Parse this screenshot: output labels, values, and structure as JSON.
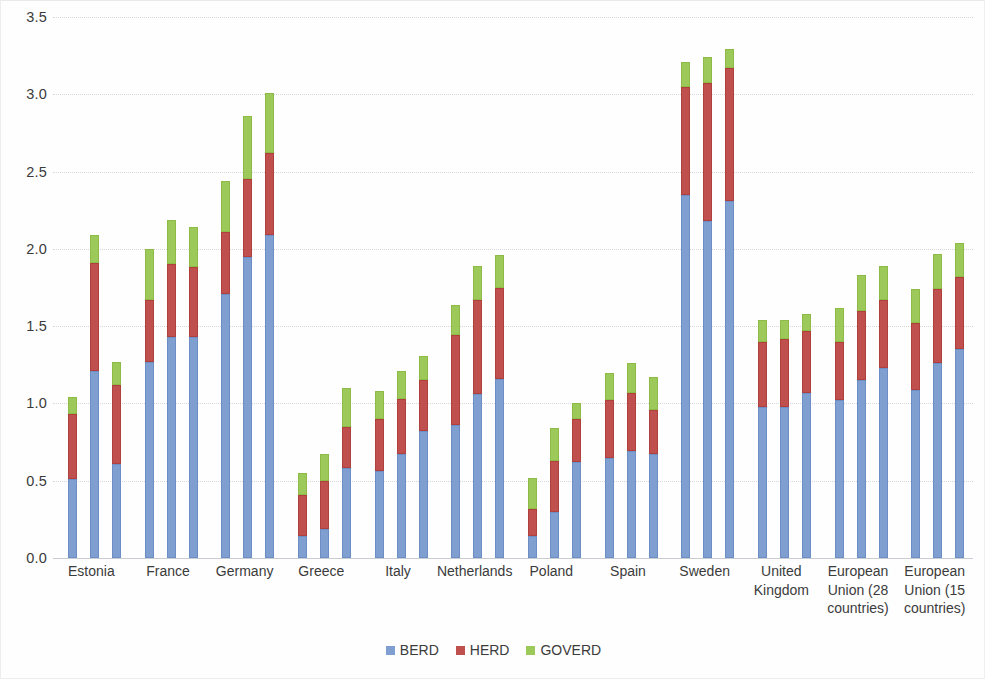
{
  "chart_data": {
    "type": "bar",
    "subtype": "stacked-bar-grouped",
    "title": "",
    "xlabel": "",
    "ylabel": "",
    "ylim": [
      0.0,
      3.5
    ],
    "ytick_labels": [
      "0.0",
      "0.5",
      "1.0",
      "1.5",
      "2.0",
      "2.5",
      "3.0",
      "3.5"
    ],
    "ytick_values": [
      0.0,
      0.5,
      1.0,
      1.5,
      2.0,
      2.5,
      3.0,
      3.5
    ],
    "grid": true,
    "legend_position": "bottom",
    "series": [
      {
        "name": "BERD",
        "color": "#7f9fd0"
      },
      {
        "name": "HERD",
        "color": "#c0504d"
      },
      {
        "name": "GOVERD",
        "color": "#9dc95a"
      }
    ],
    "categories": [
      "Estonia",
      "France",
      "Germany",
      "Greece",
      "Italy",
      "Netherlands",
      "Poland",
      "Spain",
      "Sweden",
      "United\nKingdom",
      "European\nUnion (28\ncountries)",
      "European\nUnion (15\ncountries)"
    ],
    "bars_per_category": 3,
    "groups": [
      {
        "category": "Estonia",
        "bars": [
          {
            "BERD": 0.51,
            "HERD": 0.42,
            "GOVERD": 0.11
          },
          {
            "BERD": 1.21,
            "HERD": 0.7,
            "GOVERD": 0.18
          },
          {
            "BERD": 0.61,
            "HERD": 0.51,
            "GOVERD": 0.15
          }
        ]
      },
      {
        "category": "France",
        "bars": [
          {
            "BERD": 1.27,
            "HERD": 0.4,
            "GOVERD": 0.33
          },
          {
            "BERD": 1.43,
            "HERD": 0.47,
            "GOVERD": 0.29
          },
          {
            "BERD": 1.43,
            "HERD": 0.45,
            "GOVERD": 0.26
          }
        ]
      },
      {
        "category": "Germany",
        "bars": [
          {
            "BERD": 1.71,
            "HERD": 0.4,
            "GOVERD": 0.33
          },
          {
            "BERD": 1.95,
            "HERD": 0.5,
            "GOVERD": 0.41
          },
          {
            "BERD": 2.09,
            "HERD": 0.53,
            "GOVERD": 0.39
          }
        ]
      },
      {
        "category": "Greece",
        "bars": [
          {
            "BERD": 0.14,
            "HERD": 0.27,
            "GOVERD": 0.14
          },
          {
            "BERD": 0.19,
            "HERD": 0.31,
            "GOVERD": 0.17
          },
          {
            "BERD": 0.58,
            "HERD": 0.27,
            "GOVERD": 0.25
          }
        ]
      },
      {
        "category": "Italy",
        "bars": [
          {
            "BERD": 0.56,
            "HERD": 0.34,
            "GOVERD": 0.18
          },
          {
            "BERD": 0.67,
            "HERD": 0.36,
            "GOVERD": 0.18
          },
          {
            "BERD": 0.82,
            "HERD": 0.33,
            "GOVERD": 0.16
          }
        ]
      },
      {
        "category": "Netherlands",
        "bars": [
          {
            "BERD": 0.86,
            "HERD": 0.58,
            "GOVERD": 0.2
          },
          {
            "BERD": 1.06,
            "HERD": 0.61,
            "GOVERD": 0.22
          },
          {
            "BERD": 1.16,
            "HERD": 0.59,
            "GOVERD": 0.21
          }
        ]
      },
      {
        "category": "Poland",
        "bars": [
          {
            "BERD": 0.14,
            "HERD": 0.18,
            "GOVERD": 0.2
          },
          {
            "BERD": 0.3,
            "HERD": 0.33,
            "GOVERD": 0.21
          },
          {
            "BERD": 0.62,
            "HERD": 0.28,
            "GOVERD": 0.1
          }
        ]
      },
      {
        "category": "Spain",
        "bars": [
          {
            "BERD": 0.65,
            "HERD": 0.37,
            "GOVERD": 0.18
          },
          {
            "BERD": 0.69,
            "HERD": 0.38,
            "GOVERD": 0.19
          },
          {
            "BERD": 0.67,
            "HERD": 0.29,
            "GOVERD": 0.21
          }
        ]
      },
      {
        "category": "Sweden",
        "bars": [
          {
            "BERD": 2.35,
            "HERD": 0.7,
            "GOVERD": 0.16
          },
          {
            "BERD": 2.18,
            "HERD": 0.89,
            "GOVERD": 0.17
          },
          {
            "BERD": 2.31,
            "HERD": 0.86,
            "GOVERD": 0.12
          }
        ]
      },
      {
        "category": "United Kingdom",
        "bars": [
          {
            "BERD": 0.98,
            "HERD": 0.42,
            "GOVERD": 0.14
          },
          {
            "BERD": 0.98,
            "HERD": 0.44,
            "GOVERD": 0.12
          },
          {
            "BERD": 1.07,
            "HERD": 0.4,
            "GOVERD": 0.11
          }
        ]
      },
      {
        "category": "European Union (28 countries)",
        "bars": [
          {
            "BERD": 1.02,
            "HERD": 0.38,
            "GOVERD": 0.22
          },
          {
            "BERD": 1.15,
            "HERD": 0.45,
            "GOVERD": 0.23
          },
          {
            "BERD": 1.23,
            "HERD": 0.44,
            "GOVERD": 0.22
          }
        ]
      },
      {
        "category": "European Union (15 countries)",
        "bars": [
          {
            "BERD": 1.09,
            "HERD": 0.43,
            "GOVERD": 0.22
          },
          {
            "BERD": 1.26,
            "HERD": 0.48,
            "GOVERD": 0.23
          },
          {
            "BERD": 1.35,
            "HERD": 0.47,
            "GOVERD": 0.22
          }
        ]
      }
    ]
  },
  "legend": {
    "items": [
      {
        "label": "BERD",
        "key": "BERD"
      },
      {
        "label": "HERD",
        "key": "HERD"
      },
      {
        "label": "GOVERD",
        "key": "GOVERD"
      }
    ]
  }
}
